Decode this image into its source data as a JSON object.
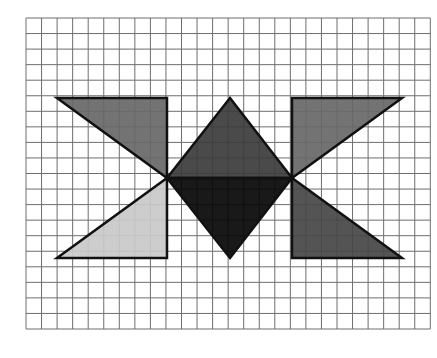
{
  "grid": {
    "x0": 26,
    "y0": 18,
    "cell": 15.55,
    "cols": 26,
    "rows": 20,
    "line_color": "#6e6e6e"
  },
  "shapes": [
    {
      "name": "upper-left-triangle",
      "fill": "#676767",
      "points": [
        [
          57,
          98
        ],
        [
          167,
          98
        ],
        [
          167,
          178
        ]
      ]
    },
    {
      "name": "lower-left-triangle",
      "fill": "#c9c9c9",
      "points": [
        [
          57,
          258
        ],
        [
          167,
          258
        ],
        [
          167,
          178
        ]
      ]
    },
    {
      "name": "upper-right-triangle",
      "fill": "#676767",
      "points": [
        [
          292,
          98
        ],
        [
          402,
          98
        ],
        [
          292,
          178
        ]
      ]
    },
    {
      "name": "lower-right-triangle",
      "fill": "#454545",
      "points": [
        [
          292,
          178
        ],
        [
          292,
          258
        ],
        [
          402,
          258
        ]
      ]
    },
    {
      "name": "diamond-upper-half",
      "fill": "#3b3b3b",
      "points": [
        [
          230,
          98
        ],
        [
          292,
          178
        ],
        [
          167,
          178
        ]
      ]
    },
    {
      "name": "diamond-lower-half",
      "fill": "#050505",
      "points": [
        [
          167,
          178
        ],
        [
          292,
          178
        ],
        [
          230,
          258
        ]
      ]
    }
  ],
  "stroke": "#111111"
}
